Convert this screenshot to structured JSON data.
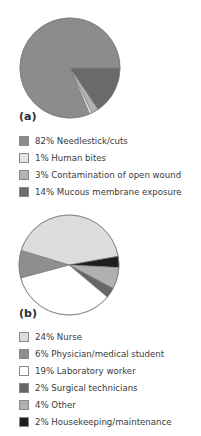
{
  "chart_data": [
    {
      "type": "pie",
      "panel_label": "(a)",
      "title": "",
      "categories": [
        "Needlestick/cuts",
        "Human bites",
        "Contamination of open wound",
        "Mucous membrane exposure"
      ],
      "values": [
        82,
        1,
        3,
        14
      ],
      "colors": [
        "#8c8c8c",
        "#e4e4e4",
        "#b3b3b3",
        "#6a6a6a"
      ],
      "legend": [
        {
          "label": "82% Needlestick/cuts",
          "color": "#8c8c8c"
        },
        {
          "label": "1% Human bites",
          "color": "#e4e4e4"
        },
        {
          "label": "3% Contamination of open wound",
          "color": "#b3b3b3"
        },
        {
          "label": "14% Mucous membrane exposure",
          "color": "#6a6a6a"
        }
      ],
      "legend_position": "bottom"
    },
    {
      "type": "pie",
      "panel_label": "(b)",
      "title": "",
      "categories": [
        "Nurse",
        "Physician/medical student",
        "Laboratory worker",
        "Surgical technicians",
        "Other",
        "Housekeeping/maintenance"
      ],
      "values": [
        24,
        6,
        19,
        2,
        4,
        2
      ],
      "colors": [
        "#dcdcdc",
        "#8e8e8e",
        "#ffffff",
        "#666666",
        "#b0b0b0",
        "#1e1e1e"
      ],
      "legend": [
        {
          "label": "24% Nurse",
          "color": "#dcdcdc"
        },
        {
          "label": "6% Physician/medical student",
          "color": "#8e8e8e"
        },
        {
          "label": "19% Laboratory worker",
          "color": "#ffffff"
        },
        {
          "label": "2% Surgical technicians",
          "color": "#666666"
        },
        {
          "label": "4% Other",
          "color": "#b0b0b0"
        },
        {
          "label": "2% Housekeeping/maintenance",
          "color": "#1e1e1e"
        }
      ],
      "legend_position": "bottom"
    }
  ]
}
